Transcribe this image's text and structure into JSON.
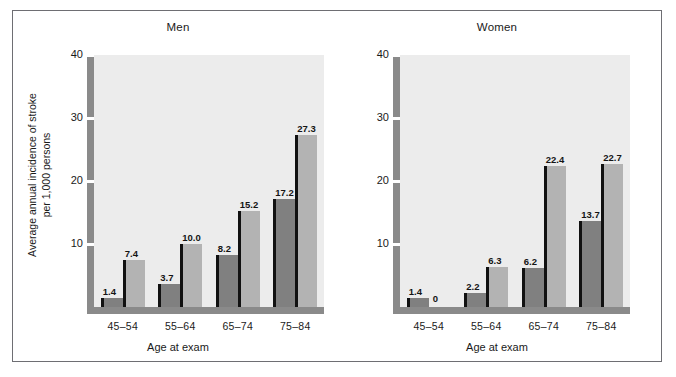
{
  "figure": {
    "y_axis_title_line1": "Average annual incidence of stroke",
    "y_axis_title_line2": "per 1,000 persons",
    "x_axis_title": "Age at exam"
  },
  "legend": {
    "items": [
      {
        "label": "No diabetes",
        "color": "#808080"
      },
      {
        "label": "Diabetes",
        "color": "#b3b3b3"
      }
    ]
  },
  "colors": {
    "no_diabetes": "#808080",
    "diabetes": "#b3b3b3",
    "plot_background": "#ececec",
    "axis": "#8a8a8a",
    "bar_edge": "#111111",
    "frame": "#6e6e73"
  },
  "chart_data": {
    "type": "bar",
    "title": "",
    "xlabel": "Age at exam",
    "ylabel": "Average annual incidence of stroke per 1,000 persons",
    "ylim": [
      0,
      40
    ],
    "yticks": [
      10,
      20,
      30,
      40
    ],
    "grid": false,
    "legend_position": "top-left of Men panel",
    "categories": [
      "45–54",
      "55–64",
      "65–74",
      "75–84"
    ],
    "panels": [
      {
        "title": "Men",
        "series": [
          {
            "name": "No diabetes",
            "values": [
              1.4,
              3.7,
              8.2,
              17.2
            ],
            "labels": [
              "1.4",
              "3.7",
              "8.2",
              "17.2"
            ]
          },
          {
            "name": "Diabetes",
            "values": [
              7.4,
              10.0,
              15.2,
              27.3
            ],
            "labels": [
              "7.4",
              "10.0",
              "15.2",
              "27.3"
            ]
          }
        ]
      },
      {
        "title": "Women",
        "series": [
          {
            "name": "No diabetes",
            "values": [
              1.4,
              2.2,
              6.2,
              13.7
            ],
            "labels": [
              "1.4",
              "2.2",
              "6.2",
              "13.7"
            ]
          },
          {
            "name": "Diabetes",
            "values": [
              0,
              6.3,
              22.4,
              22.7
            ],
            "labels": [
              "0",
              "6.3",
              "22.4",
              "22.7"
            ]
          }
        ]
      }
    ]
  },
  "ytick_labels": [
    "40",
    "30",
    "20",
    "10"
  ]
}
